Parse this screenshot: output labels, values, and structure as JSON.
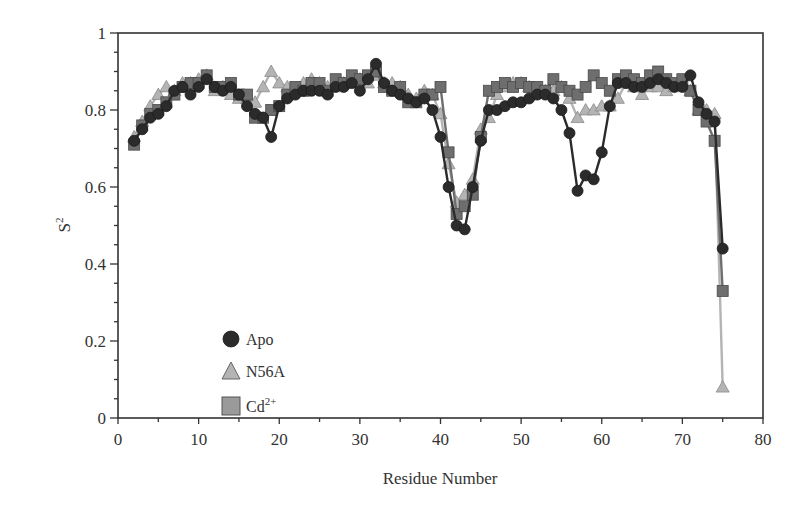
{
  "chart_data": {
    "type": "line",
    "title": "",
    "xlabel": "Residue Number",
    "ylabel": "S2",
    "xlim": [
      0,
      80
    ],
    "ylim": [
      0,
      1
    ],
    "xticks": [
      0,
      10,
      20,
      30,
      40,
      50,
      60,
      70,
      80
    ],
    "yticks": [
      0,
      0.2,
      0.4,
      0.6,
      0.8,
      1
    ],
    "ytick_labels": [
      "0",
      "0.2",
      "0.4",
      "0.6",
      "0.8",
      "1"
    ],
    "grid": false,
    "legend_position": "lower-left inside",
    "series": [
      {
        "name": "Apo",
        "marker": "circle",
        "color": "#2b2b2b",
        "x": [
          2,
          3,
          4,
          5,
          6,
          7,
          8,
          9,
          10,
          11,
          12,
          13,
          14,
          15,
          16,
          17,
          18,
          19,
          20,
          21,
          22,
          23,
          24,
          25,
          26,
          27,
          28,
          29,
          30,
          31,
          32,
          33,
          34,
          35,
          36,
          37,
          38,
          39,
          40,
          41,
          42,
          43,
          44,
          45,
          46,
          47,
          48,
          49,
          50,
          51,
          52,
          53,
          54,
          55,
          56,
          57,
          58,
          59,
          60,
          61,
          62,
          63,
          64,
          65,
          66,
          67,
          68,
          69,
          70,
          71,
          72,
          73,
          74,
          75
        ],
        "values": [
          0.72,
          0.75,
          0.78,
          0.79,
          0.81,
          0.85,
          0.86,
          0.84,
          0.86,
          0.88,
          0.86,
          0.85,
          0.86,
          0.84,
          0.81,
          0.79,
          0.78,
          0.73,
          0.81,
          0.83,
          0.84,
          0.85,
          0.85,
          0.85,
          0.84,
          0.86,
          0.86,
          0.87,
          0.85,
          0.88,
          0.92,
          0.87,
          0.85,
          0.84,
          0.83,
          0.82,
          0.83,
          0.8,
          0.73,
          0.6,
          0.5,
          0.49,
          0.6,
          0.72,
          0.8,
          0.8,
          0.81,
          0.82,
          0.82,
          0.83,
          0.84,
          0.84,
          0.83,
          0.8,
          0.74,
          0.59,
          0.63,
          0.62,
          0.69,
          0.81,
          0.87,
          0.87,
          0.86,
          0.86,
          0.87,
          0.88,
          0.87,
          0.86,
          0.86,
          0.89,
          0.82,
          0.79,
          0.77,
          0.44
        ]
      },
      {
        "name": "N56A",
        "marker": "triangle",
        "color": "#b4b4b4",
        "x": [
          2,
          3,
          4,
          5,
          6,
          7,
          8,
          9,
          10,
          11,
          12,
          13,
          14,
          15,
          16,
          17,
          18,
          19,
          20,
          21,
          22,
          23,
          24,
          25,
          26,
          27,
          28,
          29,
          30,
          31,
          32,
          33,
          34,
          35,
          36,
          37,
          38,
          39,
          40,
          41,
          42,
          43,
          44,
          45,
          46,
          47,
          48,
          49,
          50,
          51,
          52,
          53,
          54,
          55,
          56,
          57,
          58,
          59,
          60,
          61,
          62,
          63,
          64,
          65,
          66,
          67,
          68,
          69,
          70,
          71,
          72,
          73,
          74,
          75
        ],
        "values": [
          0.73,
          0.77,
          0.81,
          0.84,
          0.86,
          0.85,
          0.87,
          0.87,
          0.88,
          0.89,
          0.85,
          0.86,
          0.84,
          0.83,
          0.83,
          0.82,
          0.86,
          0.9,
          0.87,
          0.86,
          0.85,
          0.87,
          0.88,
          0.87,
          0.86,
          0.86,
          0.87,
          0.88,
          0.88,
          0.87,
          0.89,
          0.87,
          0.87,
          0.86,
          0.84,
          0.83,
          0.85,
          0.84,
          0.79,
          0.66,
          0.56,
          0.58,
          0.62,
          0.75,
          0.78,
          0.84,
          0.86,
          0.87,
          0.87,
          0.86,
          0.85,
          0.85,
          0.85,
          0.86,
          0.83,
          0.78,
          0.8,
          0.8,
          0.81,
          0.81,
          0.83,
          0.87,
          0.86,
          0.84,
          0.86,
          0.86,
          0.85,
          0.86,
          0.87,
          0.85,
          0.8,
          0.8,
          0.79,
          0.08
        ]
      },
      {
        "name": "Cd2+",
        "marker": "square",
        "color": "#6e6e6e",
        "x": [
          2,
          3,
          4,
          5,
          6,
          7,
          8,
          9,
          10,
          11,
          12,
          13,
          14,
          15,
          16,
          17,
          18,
          19,
          20,
          21,
          22,
          23,
          24,
          25,
          26,
          27,
          28,
          29,
          30,
          31,
          32,
          33,
          34,
          35,
          36,
          37,
          38,
          39,
          40,
          41,
          42,
          43,
          44,
          45,
          46,
          47,
          48,
          49,
          50,
          51,
          52,
          53,
          54,
          55,
          56,
          57,
          58,
          59,
          60,
          61,
          62,
          63,
          64,
          65,
          66,
          67,
          68,
          69,
          70,
          71,
          72,
          73,
          74,
          75
        ],
        "values": [
          0.71,
          0.76,
          0.79,
          0.8,
          0.82,
          0.84,
          0.86,
          0.87,
          0.87,
          0.89,
          0.86,
          0.86,
          0.87,
          0.84,
          0.84,
          0.78,
          0.78,
          0.8,
          0.81,
          0.84,
          0.86,
          0.85,
          0.87,
          0.87,
          0.85,
          0.88,
          0.87,
          0.89,
          0.88,
          0.89,
          0.9,
          0.86,
          0.85,
          0.86,
          0.82,
          0.82,
          0.84,
          0.84,
          0.86,
          0.69,
          0.53,
          0.55,
          0.58,
          0.73,
          0.85,
          0.86,
          0.87,
          0.86,
          0.87,
          0.86,
          0.86,
          0.85,
          0.88,
          0.86,
          0.85,
          0.84,
          0.86,
          0.89,
          0.87,
          0.85,
          0.88,
          0.89,
          0.88,
          0.87,
          0.89,
          0.9,
          0.88,
          0.87,
          0.88,
          0.85,
          0.8,
          0.77,
          0.72,
          0.33
        ]
      }
    ]
  },
  "legend": {
    "items": [
      {
        "label": "Apo",
        "marker": "circle"
      },
      {
        "label": "N56A",
        "marker": "triangle"
      },
      {
        "label": "Cd",
        "superscript": "2+",
        "marker": "square"
      }
    ]
  },
  "axes": {
    "xlabel": "Residue Number",
    "ylabel_base": "S",
    "ylabel_sup": "2"
  }
}
